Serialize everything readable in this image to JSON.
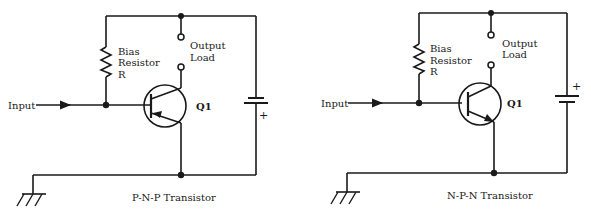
{
  "diagrams": [
    {
      "caption": "P-N-P Transistor",
      "input_label": "Input",
      "resistor_label": [
        "Bias",
        "Resistor",
        "R"
      ],
      "load_label": [
        "Output",
        "Load"
      ],
      "transistor_label": "Q1",
      "battery_polarity": "+",
      "battery_plus_position": "below"
    },
    {
      "caption": "N-P-N Transistor",
      "input_label": "Input",
      "resistor_label": [
        "Bias",
        "Resistor",
        "R"
      ],
      "load_label": [
        "Output",
        "Load"
      ],
      "transistor_label": "Q1",
      "battery_polarity": "+",
      "battery_plus_position": "above"
    }
  ],
  "colors": {
    "ink": "#1a1a1a",
    "background": "#ffffff"
  }
}
